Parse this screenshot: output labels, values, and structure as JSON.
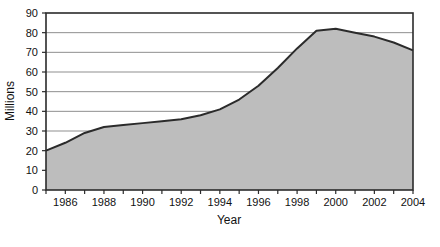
{
  "chart_data": {
    "type": "area",
    "title": "",
    "xlabel": "Year",
    "ylabel": "Millions",
    "xlim": [
      1985,
      2004
    ],
    "ylim": [
      0,
      90
    ],
    "grid": true,
    "legend": "none",
    "y_ticks": [
      0,
      10,
      20,
      30,
      40,
      50,
      60,
      70,
      80,
      90
    ],
    "x_ticks": [
      1985,
      1986,
      1987,
      1988,
      1989,
      1990,
      1991,
      1992,
      1993,
      1994,
      1995,
      1996,
      1997,
      1998,
      1999,
      2000,
      2001,
      2002,
      2003,
      2004
    ],
    "x_tick_labels": [
      "",
      "1986",
      "",
      "1988",
      "",
      "1990",
      "",
      "1992",
      "",
      "1994",
      "",
      "1996",
      "",
      "1998",
      "",
      "2000",
      "",
      "2002",
      "",
      "2004"
    ],
    "x": [
      1985,
      1986,
      1987,
      1988,
      1989,
      1990,
      1991,
      1992,
      1993,
      1994,
      1995,
      1996,
      1997,
      1998,
      1999,
      2000,
      2001,
      2002,
      2003,
      2004
    ],
    "values": [
      20,
      24,
      29,
      32,
      33,
      34,
      35,
      36,
      38,
      41,
      46,
      53,
      62,
      72,
      81,
      82,
      80,
      78,
      75,
      71
    ],
    "series": [
      {
        "name": "Millions",
        "values": [
          20,
          24,
          29,
          32,
          33,
          34,
          35,
          36,
          38,
          41,
          46,
          53,
          62,
          72,
          81,
          82,
          80,
          78,
          75,
          71
        ]
      }
    ],
    "colors": {
      "area_fill": "#bdbdbd",
      "line": "#2b2b2b",
      "grid": "#8f8f8f",
      "axis": "#2b2b2b",
      "background": "#ffffff"
    }
  }
}
